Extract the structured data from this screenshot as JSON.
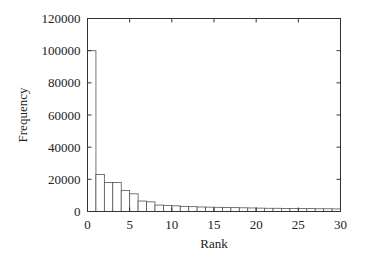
{
  "chart_data": {
    "type": "bar",
    "title": "",
    "xlabel": "Rank",
    "ylabel": "Frequency",
    "xlim": [
      0,
      30
    ],
    "ylim": [
      0,
      120000
    ],
    "x_ticks": [
      0,
      5,
      10,
      15,
      20,
      25,
      30
    ],
    "y_ticks": [
      0,
      20000,
      40000,
      60000,
      80000,
      100000,
      120000
    ],
    "grid": false,
    "legend": null,
    "categories": [
      1,
      2,
      3,
      4,
      5,
      6,
      7,
      8,
      9,
      10,
      11,
      12,
      13,
      14,
      15,
      16,
      17,
      18,
      19,
      20,
      21,
      22,
      23,
      24,
      25,
      26,
      27,
      28,
      29,
      30
    ],
    "values": [
      100000,
      23000,
      18000,
      18000,
      13000,
      11000,
      6500,
      6000,
      4000,
      3800,
      3500,
      3200,
      3000,
      2800,
      2700,
      2600,
      2500,
      2400,
      2300,
      2200,
      2100,
      2000,
      2000,
      1900,
      1900,
      1800,
      1800,
      1700,
      1700,
      1600
    ],
    "bar_style": {
      "fill": "#ffffff",
      "stroke": "#555555"
    }
  }
}
